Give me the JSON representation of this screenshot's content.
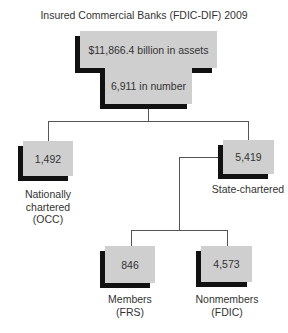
{
  "title": "Insured Commercial Banks (FDIC-DIF) 2009",
  "root": {
    "assets": "$11,866.4 billion in assets",
    "number": "6,911 in number"
  },
  "nodes": {
    "national": {
      "value": "1,492",
      "label_lines": [
        "Nationally",
        "chartered",
        "(OCC)"
      ]
    },
    "state": {
      "value": "5,419",
      "label_lines": [
        "State-chartered"
      ]
    },
    "members": {
      "value": "846",
      "label_lines": [
        "Members",
        "(FRS)"
      ]
    },
    "nonmembers": {
      "value": "4,573",
      "label_lines": [
        "Nonmembers",
        "(FDIC)"
      ]
    }
  },
  "colors": {
    "box_fill": "#cfcfcf",
    "shadow": "#111111",
    "line": "#555555"
  }
}
